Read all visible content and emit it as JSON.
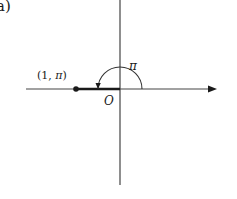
{
  "diagram": {
    "part_label": "a)",
    "point": {
      "label_prefix": "(1, ",
      "label_pi": "π",
      "label_suffix": ")",
      "polar_r": 1,
      "polar_theta": "π"
    },
    "angle_label": "π",
    "origin_label": "O",
    "colors": {
      "ink": "#1a1a1a",
      "axis": "#333333",
      "background": "#ffffff"
    }
  }
}
